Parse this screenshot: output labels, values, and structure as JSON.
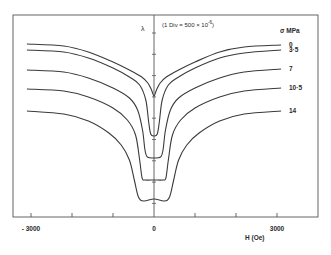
{
  "chart_data": {
    "type": "line",
    "title": "",
    "ylabel": "λ",
    "y_scale_note": "(1 Div = 500 × 10",
    "y_scale_exp": "-6",
    "y_scale_close": ")",
    "xlabel": "H (Oe)",
    "legend_title": "σ MPa",
    "xlim": [
      -3500,
      4000
    ],
    "x_ticks": [
      -3000,
      -2000,
      -1000,
      0,
      1000,
      2000,
      3000
    ],
    "x_tick_labels": [
      {
        "value": -3000,
        "label": "- 3000"
      },
      {
        "value": 0,
        "label": "0"
      },
      {
        "value": 3000,
        "label": "3000"
      }
    ],
    "y_unit_per_div": "500 × 10^-6",
    "grid": false,
    "series": [
      {
        "name": "0",
        "label": "0",
        "points": [
          [
            -3100,
            44
          ],
          [
            -2200,
            46
          ],
          [
            -1600,
            52
          ],
          [
            -1000,
            62
          ],
          [
            -600,
            70
          ],
          [
            -300,
            77
          ],
          [
            -150,
            83
          ],
          [
            -60,
            90
          ],
          [
            0,
            96
          ],
          [
            60,
            90
          ],
          [
            150,
            83
          ],
          [
            300,
            77
          ],
          [
            600,
            70
          ],
          [
            1000,
            62
          ],
          [
            1600,
            52
          ],
          [
            2200,
            47
          ],
          [
            3100,
            45
          ]
        ]
      },
      {
        "name": "3.5",
        "label": "3·5",
        "points": [
          [
            -3100,
            50
          ],
          [
            -2200,
            52
          ],
          [
            -1600,
            58
          ],
          [
            -1000,
            68
          ],
          [
            -600,
            77
          ],
          [
            -350,
            85
          ],
          [
            -200,
            100
          ],
          [
            -130,
            122
          ],
          [
            -80,
            134
          ],
          [
            0,
            136
          ],
          [
            80,
            134
          ],
          [
            130,
            122
          ],
          [
            200,
            100
          ],
          [
            350,
            85
          ],
          [
            600,
            77
          ],
          [
            1000,
            68
          ],
          [
            1600,
            58
          ],
          [
            2200,
            53
          ],
          [
            3100,
            50
          ]
        ]
      },
      {
        "name": "7",
        "label": "7",
        "points": [
          [
            -3100,
            70
          ],
          [
            -2200,
            72
          ],
          [
            -1600,
            78
          ],
          [
            -1000,
            88
          ],
          [
            -600,
            98
          ],
          [
            -400,
            110
          ],
          [
            -280,
            130
          ],
          [
            -220,
            150
          ],
          [
            -160,
            157
          ],
          [
            0,
            158
          ],
          [
            160,
            157
          ],
          [
            220,
            150
          ],
          [
            280,
            130
          ],
          [
            400,
            110
          ],
          [
            600,
            98
          ],
          [
            1000,
            88
          ],
          [
            1600,
            78
          ],
          [
            2200,
            72
          ],
          [
            3100,
            69
          ]
        ]
      },
      {
        "name": "10.5",
        "label": "10·5",
        "points": [
          [
            -3100,
            89
          ],
          [
            -2200,
            91
          ],
          [
            -1600,
            97
          ],
          [
            -1000,
            108
          ],
          [
            -650,
            120
          ],
          [
            -450,
            135
          ],
          [
            -350,
            160
          ],
          [
            -290,
            178
          ],
          [
            -220,
            180
          ],
          [
            0,
            180
          ],
          [
            220,
            180
          ],
          [
            290,
            178
          ],
          [
            350,
            160
          ],
          [
            450,
            135
          ],
          [
            650,
            120
          ],
          [
            1000,
            108
          ],
          [
            1600,
            97
          ],
          [
            2200,
            91
          ],
          [
            3100,
            88
          ]
        ]
      },
      {
        "name": "14",
        "label": "14",
        "points": [
          [
            -3100,
            111
          ],
          [
            -2200,
            114
          ],
          [
            -1600,
            121
          ],
          [
            -1100,
            133
          ],
          [
            -800,
            145
          ],
          [
            -600,
            160
          ],
          [
            -480,
            180
          ],
          [
            -380,
            197
          ],
          [
            -250,
            201
          ],
          [
            0,
            199
          ],
          [
            250,
            201
          ],
          [
            380,
            197
          ],
          [
            480,
            180
          ],
          [
            600,
            160
          ],
          [
            800,
            145
          ],
          [
            1100,
            133
          ],
          [
            1600,
            121
          ],
          [
            2200,
            114
          ],
          [
            3100,
            111
          ]
        ]
      }
    ]
  }
}
